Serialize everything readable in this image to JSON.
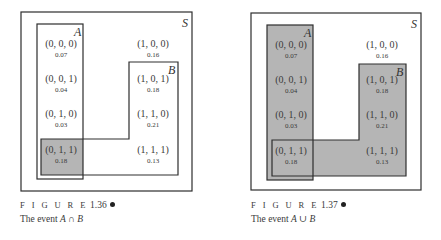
{
  "colors": {
    "shade": "#b5b5b5",
    "stroke": "#2e2e2e",
    "text": "#3a3a3a"
  },
  "figures": [
    {
      "number": "1.36",
      "caption_prefix": "F I G U R E",
      "caption_text": "The event",
      "event_expr": "A ∩ B",
      "shaded": "intersection"
    },
    {
      "number": "1.37",
      "caption_prefix": "F I G U R E",
      "caption_text": "The event",
      "event_expr": "A ∪ B",
      "shaded": "union"
    }
  ],
  "labels": {
    "sample_space": "S",
    "set_a": "A",
    "set_b": "B"
  },
  "outcomes": [
    {
      "tuple": "(0, 0, 0)",
      "prob": "0.07"
    },
    {
      "tuple": "(0, 0, 1)",
      "prob": "0.04"
    },
    {
      "tuple": "(0, 1, 0)",
      "prob": "0.03"
    },
    {
      "tuple": "(0, 1, 1)",
      "prob": "0.18"
    },
    {
      "tuple": "(1, 0, 0)",
      "prob": "0.16"
    },
    {
      "tuple": "(1, 0, 1)",
      "prob": "0.18"
    },
    {
      "tuple": "(1, 1, 0)",
      "prob": "0.21"
    },
    {
      "tuple": "(1, 1, 1)",
      "prob": "0.13"
    }
  ]
}
